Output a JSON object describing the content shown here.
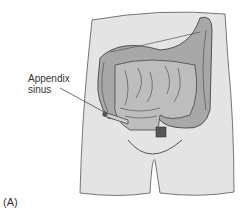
{
  "figure": {
    "panel_label": "(A)",
    "callout": {
      "line1": "Appendix",
      "line2": "sinus"
    },
    "colors": {
      "body_fill": "#e4e4e4",
      "outline": "#444444",
      "colon_fill": "#a8a8a8",
      "intestine_fill": "#b8b8b8",
      "dark_accent": "#333333"
    }
  }
}
